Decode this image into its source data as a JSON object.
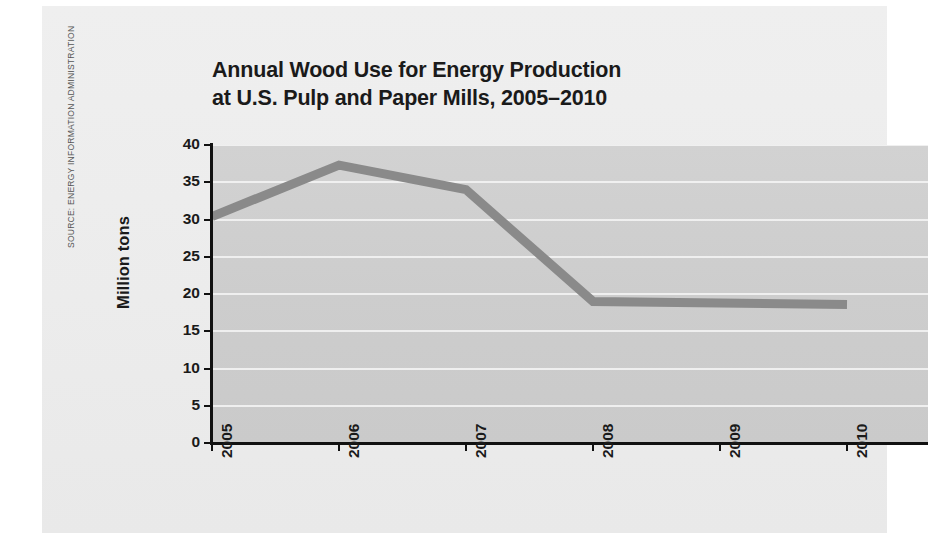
{
  "source_credit": "SOURCE: ENERGY INFORMATION ADMINISTRATION",
  "title": {
    "line1": "Annual Wood Use for Energy Production",
    "line2": "at U.S. Pulp and Paper Mills, 2005–2010"
  },
  "axis": {
    "y_title": "Million tons"
  },
  "colors": {
    "page_background": "#ffffff",
    "panel_background": "#eeeeee",
    "plot_background": "#cfcfcf",
    "gridline": "#f2f2f2",
    "series_line": "#8a8a8a",
    "axis_line": "#111111",
    "text": "#1a1a1a",
    "source_text": "#565656"
  },
  "chart_data": {
    "type": "line",
    "title": "Annual Wood Use for Energy Production at U.S. Pulp and Paper Mills, 2005–2010",
    "xlabel": "",
    "ylabel": "Million tons",
    "categories": [
      "2005",
      "2006",
      "2007",
      "2008",
      "2009",
      "2010"
    ],
    "x_tick_labels": [
      "2005",
      "2006",
      "2007",
      "2008",
      "2009",
      "2010"
    ],
    "y_tick_labels": [
      "40",
      "35",
      "30",
      "25",
      "20",
      "15",
      "10",
      "5",
      "0"
    ],
    "y_ticks": [
      40,
      35,
      30,
      25,
      20,
      15,
      10,
      5,
      0
    ],
    "ylim": [
      0,
      40
    ],
    "grid": "horizontal",
    "legend": "none",
    "series": [
      {
        "name": "Wood use",
        "color": "#8a8a8a",
        "values": [
          30.4,
          37.3,
          34.0,
          19.0,
          18.8,
          18.6
        ]
      }
    ]
  }
}
